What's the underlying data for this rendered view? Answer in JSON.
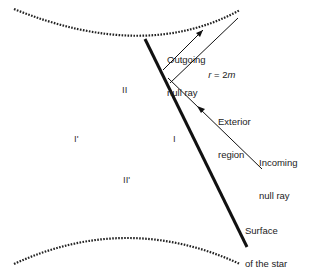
{
  "diagram": {
    "type": "spacetime-diagram",
    "title": "",
    "labels": {
      "outgoing_line1": "Outgoing",
      "outgoing_line2": "null ray",
      "horizon": "r = 2m",
      "horizon_r": "r",
      "horizon_eq": " = 2",
      "horizon_m": "m",
      "exterior_line1": "Exterior",
      "exterior_line2": "region",
      "incoming_line1": "Incoming",
      "incoming_line2": "null ray",
      "surface_line1": "Surface",
      "surface_line2": "of the star"
    },
    "regions": {
      "region_II": "II",
      "region_I_prime": "I'",
      "region_I": "I",
      "region_II_prime": "II'"
    },
    "colors": {
      "line": "#111111",
      "text": "#222222",
      "background": "#ffffff"
    },
    "elements": [
      {
        "name": "future-singularity",
        "style": "dotted-curve",
        "from": [
          14,
          9
        ],
        "mid": [
          145,
          37
        ],
        "to": [
          240,
          10
        ]
      },
      {
        "name": "past-singularity",
        "style": "dotted-curve",
        "from": [
          14,
          264
        ],
        "mid": [
          127,
          237
        ],
        "to": [
          240,
          264
        ]
      },
      {
        "name": "star-surface",
        "style": "thick-line",
        "from": [
          145,
          39
        ],
        "to": [
          247,
          247
        ]
      },
      {
        "name": "event-horizon",
        "style": "thin-line",
        "from": [
          170,
          83
        ],
        "to": [
          238,
          18
        ]
      },
      {
        "name": "outgoing-null-ray",
        "style": "thin-line-arrow",
        "from": [
          163,
          70
        ],
        "to": [
          203,
          30
        ]
      },
      {
        "name": "incoming-null-ray",
        "style": "thin-line-arrow",
        "from": [
          262,
          169
        ],
        "to": [
          168,
          78
        ]
      }
    ]
  }
}
